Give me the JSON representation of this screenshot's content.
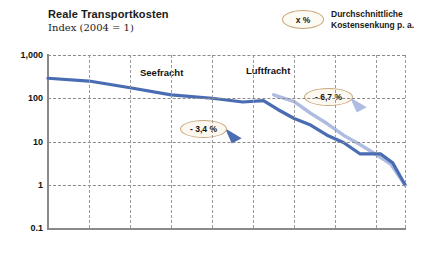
{
  "header": {
    "title": "Reale Transportkosten",
    "subtitle": "Index (2004 = 1)"
  },
  "legend": {
    "oval_label": "x %",
    "description_line1": "Durchschnittliche",
    "description_line2": "Kostensenkung p. a."
  },
  "colors": {
    "seefracht": "#4A6CB3",
    "luftfracht": "#AFBCE2",
    "callout_border": "#C9A77C",
    "callout_fill": "#FCF7EF",
    "axis": "#8A8A8A",
    "grid": "#9A9A9A"
  },
  "annotations": [
    {
      "name": "seefracht-rate",
      "text": "- 3,4 %"
    },
    {
      "name": "luftfracht-rate",
      "text": "- 6,7 %"
    }
  ],
  "chart_data": {
    "type": "line",
    "title": "Reale Transportkosten",
    "subtitle": "Index (2004 = 1)",
    "xlabel": "",
    "ylabel": "Index (2004 = 1)",
    "yscale": "log",
    "ylim": [
      0.1,
      1000
    ],
    "xlim": [
      1830,
      2004
    ],
    "grid": true,
    "legend_position": "inline-labels",
    "yticks": [
      {
        "value": 1000,
        "label": "1,000"
      },
      {
        "value": 100,
        "label": "100"
      },
      {
        "value": 10,
        "label": "10"
      },
      {
        "value": 1,
        "label": "1"
      },
      {
        "value": 0.1,
        "label": "0.1"
      }
    ],
    "xticks": [
      1830,
      1850,
      1870,
      1890,
      1910,
      1930,
      1950,
      1970,
      1990,
      2004
    ],
    "xtick_labels": [
      "1830",
      "1850",
      "1870",
      "1890",
      "1910",
      "1930",
      "1950",
      "1970",
      "1990",
      "2004"
    ],
    "series": [
      {
        "name": "Seefracht",
        "color": "#4A6CB3",
        "annotation": "- 3,4 %",
        "x": [
          1830,
          1850,
          1870,
          1890,
          1910,
          1925,
          1935,
          1942,
          1950,
          1958,
          1966,
          1974,
          1982,
          1992,
          1998,
          2004
        ],
        "y": [
          290,
          250,
          175,
          120,
          100,
          82,
          88,
          55,
          34,
          24,
          14,
          9.5,
          5.2,
          5.2,
          3.2,
          1
        ]
      },
      {
        "name": "Luftfracht",
        "color": "#AFBCE2",
        "annotation": "- 6,7 %",
        "x": [
          1940,
          1950,
          1958,
          1966,
          1974,
          1982,
          1990,
          1997,
          2004
        ],
        "y": [
          120,
          84,
          45,
          26,
          14,
          8.5,
          5.0,
          3.0,
          1
        ]
      }
    ]
  }
}
